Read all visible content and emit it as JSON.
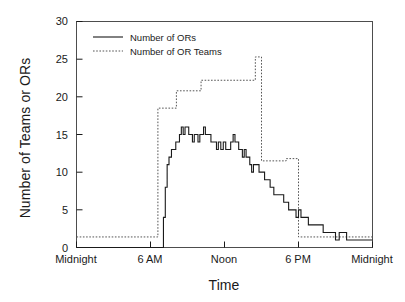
{
  "chart_data": {
    "type": "line",
    "title": "",
    "xlabel": "Time",
    "ylabel": "Number of Teams or ORs",
    "xlim": [
      0,
      24
    ],
    "ylim": [
      0,
      30
    ],
    "grid": false,
    "legend_position": "top-left-inside",
    "xticks": [
      0,
      6,
      12,
      18,
      24
    ],
    "xtick_labels": [
      "Midnight",
      "6 AM",
      "Noon",
      "6 PM",
      "Midnight"
    ],
    "yticks": [
      0,
      5,
      10,
      15,
      20,
      25,
      30
    ],
    "ytick_labels": [
      "0",
      "5",
      "10",
      "15",
      "20",
      "25",
      "30"
    ],
    "series": [
      {
        "name": "Number of ORs",
        "style": "solid",
        "color": "#1a1a1a",
        "step": true,
        "x": [
          0.0,
          6.9,
          7.05,
          7.2,
          7.35,
          7.5,
          7.7,
          7.9,
          8.05,
          8.2,
          8.35,
          8.5,
          8.65,
          8.8,
          8.95,
          9.1,
          9.25,
          9.4,
          9.55,
          9.7,
          9.85,
          10.0,
          10.15,
          10.3,
          10.45,
          10.6,
          10.75,
          10.9,
          11.05,
          11.2,
          11.35,
          11.5,
          11.7,
          11.9,
          12.1,
          12.3,
          12.5,
          12.7,
          12.85,
          13.0,
          13.15,
          13.3,
          13.45,
          13.6,
          13.75,
          13.9,
          14.05,
          14.2,
          14.35,
          14.5,
          14.65,
          14.8,
          14.95,
          15.1,
          15.25,
          15.4,
          15.55,
          15.7,
          15.85,
          16.0,
          16.2,
          16.4,
          16.6,
          16.8,
          17.0,
          17.2,
          17.4,
          17.6,
          17.8,
          18.0,
          18.2,
          18.4,
          18.6,
          18.8,
          19.0,
          19.25,
          19.5,
          19.75,
          20.0,
          20.25,
          20.5,
          20.75,
          21.0,
          21.3,
          21.6,
          21.9,
          22.2,
          22.5,
          22.8,
          23.1,
          23.4,
          24.0
        ],
        "y": [
          0,
          0,
          4,
          8,
          11,
          12,
          13,
          13,
          14,
          14,
          15,
          16,
          15,
          16,
          16,
          15,
          15,
          14,
          15,
          15,
          14,
          15,
          15,
          16,
          15,
          15,
          15,
          14,
          14,
          14,
          13,
          14,
          13,
          14,
          13,
          13,
          14,
          15,
          14,
          14,
          13,
          13,
          12,
          13,
          12,
          12,
          11,
          10,
          11,
          11,
          11,
          10,
          10,
          10,
          9,
          9,
          9,
          8,
          8,
          7,
          7,
          7,
          7,
          6,
          6,
          5,
          5,
          5,
          4,
          5,
          4,
          4,
          4,
          3,
          3,
          3,
          3,
          3,
          2,
          2,
          2,
          2,
          1,
          2,
          2,
          1,
          1,
          1,
          1,
          1,
          1,
          1
        ]
      },
      {
        "name": "Number of OR Teams",
        "style": "dotted",
        "color": "#555555",
        "step": true,
        "x": [
          0.0,
          6.6,
          6.6,
          8.1,
          8.1,
          10.1,
          10.1,
          14.5,
          14.5,
          15.0,
          15.0,
          17.0,
          17.0,
          18.0,
          18.0,
          24.0
        ],
        "y": [
          1.4,
          1.4,
          18.5,
          18.5,
          20.8,
          20.8,
          22.2,
          22.2,
          25.3,
          25.3,
          11.5,
          11.5,
          11.8,
          11.8,
          1.4,
          1.4
        ]
      }
    ],
    "legend": [
      {
        "label": "Number of ORs",
        "style": "solid"
      },
      {
        "label": "Number of OR Teams",
        "style": "dotted"
      }
    ]
  }
}
